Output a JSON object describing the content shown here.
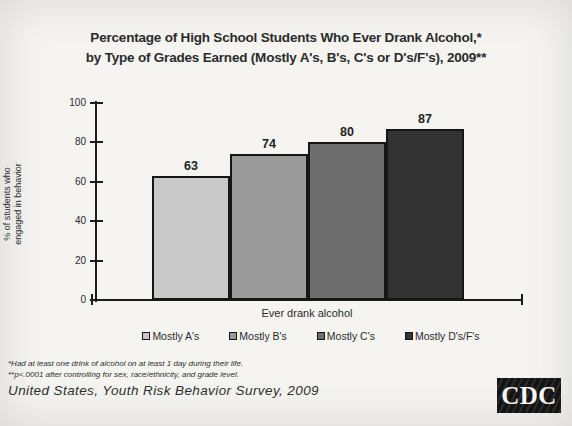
{
  "title": {
    "line1": "Percentage of High School Students Who Ever Drank Alcohol,*",
    "line2": "by Type of Grades Earned (Mostly A's, B's, C's or D's/F's), 2009**"
  },
  "chart_data": {
    "type": "bar",
    "categories": [
      "Mostly A's",
      "Mostly B's",
      "Mostly C's",
      "Mostly D's/F's"
    ],
    "values": [
      63,
      74,
      80,
      87
    ],
    "colors": [
      "#c9c9c9",
      "#9a9a9a",
      "#6d6d6d",
      "#333333"
    ],
    "xlabel": "Ever drank alcohol",
    "ylabel": "% of students who engaged in behavior",
    "ylabel_lines": [
      "% of students who",
      "engaged in behavior"
    ],
    "ylim": [
      0,
      100
    ],
    "yticks": [
      0,
      20,
      40,
      60,
      80,
      100
    ],
    "grid": false,
    "legend_position": "bottom"
  },
  "footnotes": {
    "line1": "*Had at least one drink of alcohol on at least 1 day during their life.",
    "line2": "**p<.0001 after controlling for sex, race/ethnicity, and grade level."
  },
  "source": "United States, Youth Risk Behavior Survey, 2009",
  "logo": {
    "text": "CDC"
  }
}
